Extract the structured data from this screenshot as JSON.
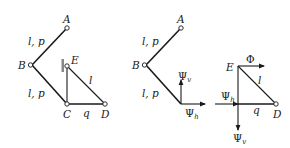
{
  "figure_left": {
    "nodes": {
      "A": "A",
      "B": "B",
      "C": "C",
      "D": "D",
      "E": "E"
    },
    "labels": {
      "ab_props": "l, p",
      "bc_props": "l, p",
      "ed_length": "l",
      "cd_load": "q"
    }
  },
  "figure_middle": {
    "nodes": {
      "A": "A",
      "B": "B"
    },
    "labels": {
      "ab_props": "l, p",
      "bc_props": "l, p"
    },
    "forces": {
      "psi_v": {
        "symbol": "Ψ",
        "sub": "v"
      },
      "psi_h": {
        "symbol": "Ψ",
        "sub": "h"
      }
    }
  },
  "figure_right": {
    "nodes": {
      "E": "E",
      "D": "D"
    },
    "labels": {
      "ed_length": "l",
      "cd_load": "q"
    },
    "forces": {
      "phi": {
        "symbol": "Φ"
      },
      "psi_h": {
        "symbol": "Ψ",
        "sub": "h"
      },
      "psi_v": {
        "symbol": "Ψ",
        "sub": "v"
      }
    }
  },
  "colors": {
    "ink": "#1a1a1a",
    "wall": "#888888",
    "background": "#ffffff"
  }
}
